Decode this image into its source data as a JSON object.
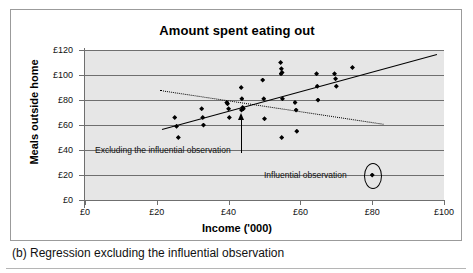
{
  "figure": {
    "caption": "(b) Regression excluding the influential observation",
    "top_remnant": ""
  },
  "chart_data": {
    "type": "scatter",
    "title": "Amount spent eating out",
    "xlabel": "Income ('000)",
    "ylabel": "Meals outside home",
    "xlim": [
      0,
      100
    ],
    "ylim": [
      0,
      120
    ],
    "xticks": [
      "£0",
      "£20",
      "£40",
      "£60",
      "£80",
      "£100"
    ],
    "xtick_values": [
      0,
      20,
      40,
      60,
      80,
      100
    ],
    "yticks": [
      "£0",
      "£20",
      "£40",
      "£60",
      "£80",
      "£100",
      "£120"
    ],
    "ytick_values": [
      0,
      20,
      40,
      60,
      80,
      100,
      120
    ],
    "grid": "horizontal",
    "legend": "none",
    "points": [
      [
        25.0,
        66.0
      ],
      [
        25.5,
        59.0
      ],
      [
        26.0,
        50.0
      ],
      [
        32.5,
        73.0
      ],
      [
        32.8,
        66.0
      ],
      [
        33.0,
        60.0
      ],
      [
        39.5,
        78.0
      ],
      [
        39.7,
        77.0
      ],
      [
        40.0,
        73.0
      ],
      [
        40.2,
        66.0
      ],
      [
        43.5,
        90.0
      ],
      [
        43.7,
        81.0
      ],
      [
        43.9,
        74.0
      ],
      [
        44.1,
        73.0
      ],
      [
        43.6,
        72.0
      ],
      [
        49.5,
        96.0
      ],
      [
        49.8,
        81.0
      ],
      [
        50.0,
        65.0
      ],
      [
        54.5,
        110.0
      ],
      [
        54.7,
        105.0
      ],
      [
        54.9,
        102.0
      ],
      [
        54.6,
        101.0
      ],
      [
        55.0,
        81.0
      ],
      [
        54.8,
        50.0
      ],
      [
        58.5,
        78.0
      ],
      [
        58.8,
        72.0
      ],
      [
        59.0,
        55.0
      ],
      [
        64.5,
        101.0
      ],
      [
        64.7,
        91.0
      ],
      [
        64.9,
        80.0
      ],
      [
        69.5,
        101.0
      ],
      [
        69.8,
        97.0
      ],
      [
        70.0,
        91.0
      ],
      [
        74.5,
        106.0
      ],
      [
        80.0,
        20.0
      ]
    ],
    "series": [
      {
        "name": "Regression excluding the influential observation",
        "style": "solid",
        "x": [
          21.5,
          98.0
        ],
        "y": [
          57.0,
          117.0
        ]
      },
      {
        "name": "Regression including the influential observation",
        "style": "dotted",
        "x": [
          20.8,
          83.0
        ],
        "y": [
          88.0,
          61.0
        ]
      }
    ],
    "annotations": [
      {
        "name": "excluding-the-influential-observation",
        "text": "Excluding the influential observation",
        "target_x": 43.5,
        "target_y": 70.0
      },
      {
        "name": "influential-observation",
        "text": "Influential observation",
        "target_x": 80.0,
        "target_y": 20.0
      }
    ]
  },
  "colors": {
    "plot_background": "#e6e6e6",
    "grid": "#6f6f6f",
    "marker": "#000000",
    "frame": "#9b9b9b",
    "page_background": "#ffffff"
  }
}
